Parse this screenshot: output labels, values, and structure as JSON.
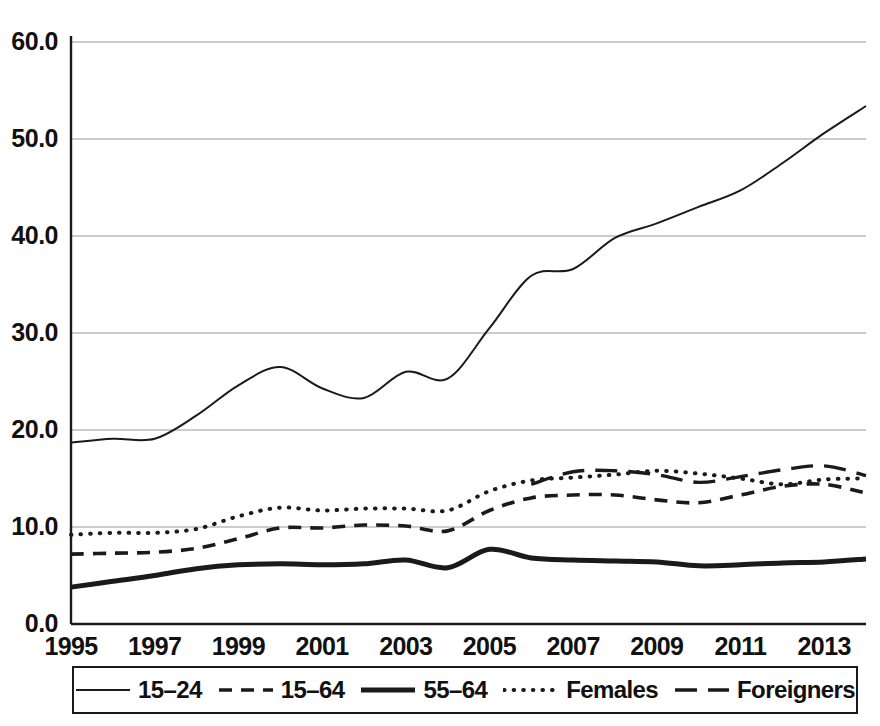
{
  "chart_data": {
    "type": "line",
    "title": "",
    "subtitle": "",
    "xlabel": "",
    "ylabel": "",
    "xlim": [
      1995,
      2014
    ],
    "ylim": [
      0.0,
      60.0
    ],
    "y_ticks": [
      "0.0",
      "10.0",
      "20.0",
      "30.0",
      "40.0",
      "50.0",
      "60.0"
    ],
    "y_tick_values": [
      0,
      10,
      20,
      30,
      40,
      50,
      60
    ],
    "x_ticks": [
      "1995",
      "1997",
      "1999",
      "2001",
      "2003",
      "2005",
      "2007",
      "2009",
      "2011",
      "2013"
    ],
    "x_tick_values": [
      1995,
      1997,
      1999,
      2001,
      2003,
      2005,
      2007,
      2009,
      2011,
      2013
    ],
    "grid": "horizontal",
    "legend_position": "below-axis",
    "x": [
      1995,
      1996,
      1997,
      1998,
      1999,
      2000,
      2001,
      2002,
      2003,
      2004,
      2005,
      2006,
      2007,
      2008,
      2009,
      2010,
      2011,
      2012,
      2013,
      2014
    ],
    "series": [
      {
        "name": "15-24",
        "style": "solid-thin",
        "values": [
          18.7,
          19.1,
          19.1,
          21.5,
          24.6,
          26.5,
          24.3,
          23.3,
          26.0,
          25.3,
          30.5,
          35.9,
          36.6,
          39.8,
          41.3,
          43.0,
          44.7,
          47.5,
          50.6,
          53.4
        ]
      },
      {
        "name": "15-64",
        "style": "dashed",
        "values": [
          7.2,
          7.3,
          7.4,
          7.8,
          8.8,
          9.9,
          9.9,
          10.2,
          10.1,
          9.6,
          11.7,
          13.0,
          13.3,
          13.3,
          12.8,
          12.5,
          13.3,
          14.2,
          14.4,
          13.5
        ]
      },
      {
        "name": "55-64",
        "style": "solid-thick",
        "values": [
          3.8,
          4.4,
          5.0,
          5.7,
          6.1,
          6.2,
          6.1,
          6.2,
          6.6,
          5.8,
          7.7,
          6.8,
          6.6,
          6.5,
          6.4,
          6.0,
          6.1,
          6.3,
          6.4,
          6.7
        ]
      },
      {
        "name": "Females",
        "style": "dotted",
        "values": [
          9.2,
          9.4,
          9.4,
          9.8,
          11.1,
          12.0,
          11.7,
          11.9,
          11.9,
          11.7,
          13.7,
          14.8,
          15.1,
          15.4,
          15.8,
          15.5,
          15.0,
          14.4,
          14.9,
          15.0
        ]
      },
      {
        "name": "Foreigners",
        "style": "long-dash",
        "values": [
          null,
          null,
          null,
          null,
          null,
          null,
          null,
          null,
          null,
          null,
          null,
          14.4,
          15.7,
          15.8,
          15.4,
          14.6,
          15.2,
          15.9,
          16.3,
          15.3
        ]
      }
    ]
  },
  "legend": {
    "items": [
      {
        "label": "15–24",
        "style": "solid-thin"
      },
      {
        "label": "15–64",
        "style": "dashed"
      },
      {
        "label": "55–64",
        "style": "solid-thick"
      },
      {
        "label": "Females",
        "style": "dotted"
      },
      {
        "label": "Foreigners",
        "style": "long-dash"
      }
    ]
  },
  "colors": {
    "line": "#1a1a1a",
    "grid": "#9a9a9a",
    "axis": "#1a1a1a",
    "background": "#ffffff",
    "text": "#111111"
  }
}
